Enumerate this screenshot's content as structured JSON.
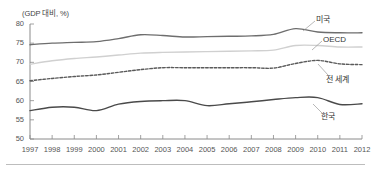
{
  "chart": {
    "axis_unit_label": "(GDP 대비, %)",
    "y_ticks": [
      80,
      75,
      70,
      65,
      60,
      55,
      50
    ],
    "x_ticks": [
      "1997",
      "1998",
      "1999",
      "2000",
      "2001",
      "2002",
      "2003",
      "2004",
      "2005",
      "2006",
      "2007",
      "2008",
      "2009",
      "2010",
      "2011",
      "2012"
    ],
    "series_labels": {
      "usa": "미국",
      "oecd": "OECD",
      "world": "전 세계",
      "korea": "한국"
    },
    "colors": {
      "usa": "#6e6e6e",
      "oecd": "#d0d0d0",
      "world": "#5a5a5a",
      "korea": "#4a4a4a",
      "axis": "#8a8a8a",
      "text": "#555555"
    }
  },
  "chart_data": {
    "type": "line",
    "title": "",
    "subtitle": "",
    "xlabel": "",
    "ylabel": "(GDP 대비, %)",
    "x": [
      1997,
      1998,
      1999,
      2000,
      2001,
      2002,
      2003,
      2004,
      2005,
      2006,
      2007,
      2008,
      2009,
      2010,
      2011,
      2012
    ],
    "categories": [
      "1997",
      "1998",
      "1999",
      "2000",
      "2001",
      "2002",
      "2003",
      "2004",
      "2005",
      "2006",
      "2007",
      "2008",
      "2009",
      "2010",
      "2011",
      "2012"
    ],
    "ylim": [
      50,
      80
    ],
    "xlim": [
      1997,
      2012
    ],
    "grid": false,
    "legend": "inline-right-annotations",
    "series": [
      {
        "name": "미국",
        "style": "solid",
        "color": "#6e6e6e",
        "values": [
          74.6,
          75.0,
          75.2,
          75.4,
          76.2,
          77.2,
          77.0,
          76.6,
          76.7,
          76.8,
          76.9,
          77.3,
          78.8,
          77.9,
          77.7,
          77.7
        ]
      },
      {
        "name": "OECD",
        "style": "solid",
        "color": "#d0d0d0",
        "values": [
          69.5,
          70.4,
          71.0,
          71.4,
          71.9,
          72.4,
          72.6,
          72.7,
          72.8,
          72.9,
          73.0,
          73.2,
          74.4,
          74.4,
          74.0,
          74.0
        ]
      },
      {
        "name": "전 세계",
        "style": "dashed",
        "color": "#5a5a5a",
        "values": [
          65.2,
          65.8,
          66.3,
          66.7,
          67.4,
          68.1,
          68.6,
          68.6,
          68.6,
          68.6,
          68.6,
          68.5,
          69.7,
          70.5,
          69.6,
          69.4
        ]
      },
      {
        "name": "한국",
        "style": "solid",
        "color": "#4a4a4a",
        "values": [
          57.4,
          58.3,
          58.3,
          57.4,
          59.1,
          59.8,
          60.0,
          60.0,
          58.7,
          59.2,
          59.7,
          60.3,
          60.8,
          60.8,
          59.0,
          59.2
        ]
      }
    ]
  }
}
